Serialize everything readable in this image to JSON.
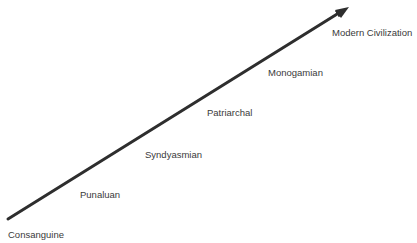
{
  "diagram": {
    "type": "progression-arrow",
    "arrow": {
      "color": "#2e2e2e",
      "start": [
        8,
        219
      ],
      "end": [
        347,
        8
      ]
    },
    "stages": [
      {
        "label": "Consanguine",
        "x": 8,
        "y": 230
      },
      {
        "label": "Punaluan",
        "x": 80,
        "y": 190
      },
      {
        "label": "Syndyasmian",
        "x": 145,
        "y": 150
      },
      {
        "label": "Patriarchal",
        "x": 207,
        "y": 108
      },
      {
        "label": "Monogamian",
        "x": 268,
        "y": 68
      },
      {
        "label": "Modern Civilization",
        "x": 332,
        "y": 28
      }
    ]
  }
}
